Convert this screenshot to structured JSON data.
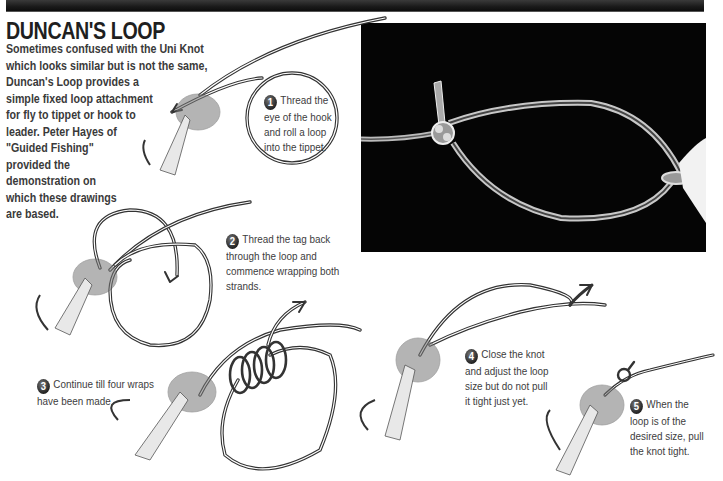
{
  "title": "DUNCAN'S LOOP",
  "intro": {
    "lines": [
      "Sometimes confused with the Uni Knot",
      "which looks similar but is not the same,",
      "Duncan's Loop provides a",
      "simple fixed loop attachment",
      "for fly to tippet or hook to",
      "leader. Peter Hayes of",
      "\"Guided Fishing\"",
      "provided the",
      "demonstration on",
      "which these drawings",
      "are based."
    ]
  },
  "steps": [
    {
      "number": "1",
      "lines": [
        "Thread the",
        "eye of the hook",
        "and roll a loop",
        "into the tippet."
      ]
    },
    {
      "number": "2",
      "lines": [
        "Thread the tag back",
        "through the loop and",
        "commence wrapping both",
        "strands."
      ]
    },
    {
      "number": "3",
      "lines": [
        "Continue till four wraps",
        "have been made."
      ]
    },
    {
      "number": "4",
      "lines": [
        "Close the knot",
        "and adjust the loop",
        "size but do not pull",
        "it tight just yet."
      ]
    },
    {
      "number": "5",
      "lines": [
        "When the",
        "loop is of the",
        "desired size, pull",
        "the knot tight."
      ]
    }
  ],
  "photo": {
    "description": "Photograph of finished Duncan's Loop knot in clear monofilament on black background"
  },
  "colors": {
    "header_band": "#1a1a1a",
    "text": "#3a3a3a",
    "photo_bg": "#050505",
    "line": "#333333"
  }
}
